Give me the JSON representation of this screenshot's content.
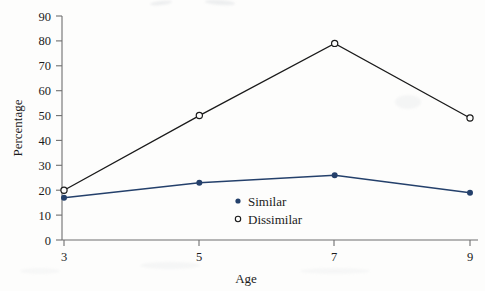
{
  "chart_data": {
    "type": "line",
    "title": "",
    "xlabel": "Age",
    "ylabel": "Percentage",
    "x": [
      3,
      5,
      7,
      9
    ],
    "xticklabels": [
      "3",
      "5",
      "7",
      "9"
    ],
    "yticks": [
      0,
      10,
      20,
      30,
      40,
      50,
      60,
      70,
      80,
      90
    ],
    "yticklabels": [
      "0",
      "10",
      "20",
      "30",
      "40",
      "50",
      "60",
      "70",
      "80",
      "90"
    ],
    "xlim": [
      3,
      9
    ],
    "ylim": [
      0,
      90
    ],
    "grid": false,
    "legend_position": "center-bottom-inside",
    "series": [
      {
        "name": "Similar",
        "values": [
          17,
          23,
          26,
          19
        ],
        "color": "#24406b",
        "marker": "filled-circle"
      },
      {
        "name": "Dissimilar",
        "values": [
          20,
          50,
          79,
          49
        ],
        "color": "#1a1a1a",
        "marker": "open-circle"
      }
    ]
  },
  "axes": {
    "y_title": "Percentage",
    "x_title": "Age",
    "y_tick_0": "0",
    "y_tick_10": "10",
    "y_tick_20": "20",
    "y_tick_30": "30",
    "y_tick_40": "40",
    "y_tick_50": "50",
    "y_tick_60": "60",
    "y_tick_70": "70",
    "y_tick_80": "80",
    "y_tick_90": "90",
    "x_tick_3": "3",
    "x_tick_5": "5",
    "x_tick_7": "7",
    "x_tick_9": "9"
  },
  "legend": {
    "similar_label": "Similar",
    "dissimilar_label": "Dissimilar"
  },
  "colors": {
    "similar": "#24406b",
    "dissimilar": "#1a1a1a",
    "axis": "#6f6f6f",
    "text": "#1b1b1b",
    "background": "#fdfdfc"
  }
}
